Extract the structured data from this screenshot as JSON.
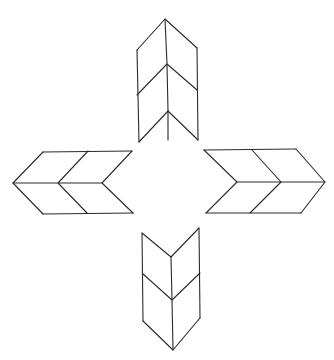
{
  "diagram": {
    "stroke_color": "#2a2a2a",
    "background": "#ffffff",
    "arrows": [
      {
        "name": "up",
        "lines": [
          [
            [
              137,
              50
            ],
            [
              165,
              19
            ],
            [
              197,
              48
            ]
          ],
          [
            [
              165,
              19
            ],
            [
              167,
              64
            ],
            [
              168,
              111
            ],
            [
              168,
              140
            ]
          ],
          [
            [
              137,
              95
            ],
            [
              167,
              64
            ],
            [
              197,
              90
            ]
          ],
          [
            [
              139,
              142
            ],
            [
              168,
              111
            ],
            [
              198,
              140
            ]
          ],
          [
            [
              137,
              50
            ],
            [
              139,
              142
            ]
          ],
          [
            [
              197,
              48
            ],
            [
              198,
              140
            ]
          ]
        ]
      },
      {
        "name": "left",
        "lines": [
          [
            [
              43,
              152
            ],
            [
              13,
              183
            ],
            [
              43,
              214
            ]
          ],
          [
            [
              43,
              152
            ],
            [
              132,
              151
            ]
          ],
          [
            [
              43,
              214
            ],
            [
              133,
              213
            ]
          ],
          [
            [
              13,
              183
            ],
            [
              58,
              183
            ],
            [
              102,
              183
            ]
          ],
          [
            [
              88,
              151
            ],
            [
              58,
              183
            ],
            [
              87,
              213
            ]
          ],
          [
            [
              132,
              151
            ],
            [
              102,
              183
            ],
            [
              133,
              213
            ]
          ]
        ]
      },
      {
        "name": "right",
        "lines": [
          [
            [
              204,
              150
            ],
            [
              296,
              149
            ]
          ],
          [
            [
              206,
              213
            ],
            [
              301,
              213
            ]
          ],
          [
            [
              296,
              149
            ],
            [
              325,
              182
            ],
            [
              301,
              213
            ]
          ],
          [
            [
              237,
              182
            ],
            [
              281,
              182
            ],
            [
              325,
              182
            ]
          ],
          [
            [
              204,
              150
            ],
            [
              237,
              182
            ],
            [
              206,
              213
            ]
          ],
          [
            [
              252,
              150
            ],
            [
              281,
              182
            ],
            [
              250,
              213
            ]
          ]
        ]
      },
      {
        "name": "down",
        "lines": [
          [
            [
              142,
              233
            ],
            [
              171,
              257
            ],
            [
              199,
              228
            ]
          ],
          [
            [
              142,
              233
            ],
            [
              143,
              321
            ]
          ],
          [
            [
              199,
              228
            ],
            [
              200,
              318
            ]
          ],
          [
            [
              171,
              257
            ],
            [
              172,
              300
            ],
            [
              173,
              350
            ]
          ],
          [
            [
              143,
              274
            ],
            [
              172,
              300
            ],
            [
              200,
              273
            ]
          ],
          [
            [
              143,
              321
            ],
            [
              173,
              350
            ],
            [
              200,
              318
            ]
          ]
        ]
      }
    ]
  }
}
